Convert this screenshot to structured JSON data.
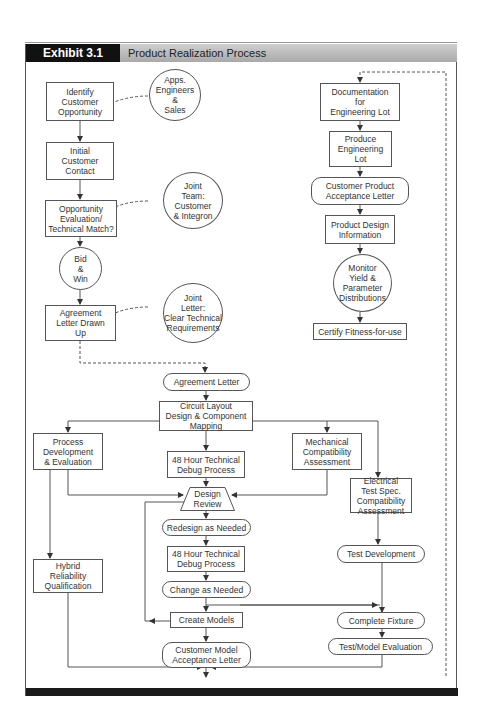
{
  "header": {
    "exhibit_label": "Exhibit 3.1",
    "title": "Product Realization Process"
  },
  "nodes": {
    "identify_customer": "Identify\nCustomer\nOpportunity",
    "apps_engineers": "Apps.\nEngineers\n&\nSales",
    "initial_contact": "Initial\nCustomer\nContact",
    "opportunity_eval": "Opportunity\nEvaluation/\nTechnical Match?",
    "joint_team": "Joint\nTeam:\nCustomer\n& Integron",
    "bid_win": "Bid\n&\nWin",
    "agreement_drawn": "Agreement\nLetter Drawn\nUp",
    "joint_letter": "Joint\nLetter:\nClear Technical\nRequirements",
    "documentation": "Documentation\nfor\nEngineering Lot",
    "produce_lot": "Produce\nEngineering\nLot",
    "cust_product_accept": "Customer Product\nAcceptance Letter",
    "product_design_info": "Product Design\nInformation",
    "monitor_yield": "Monitor\nYield &\nParameter\nDistributions",
    "certify": "Certify Fitness-for-use",
    "agreement_letter": "Agreement Letter",
    "circuit_layout": "Circuit Layout\nDesign & Component\nMapping",
    "process_dev": "Process\nDevelopment\n& Evaluation",
    "debug_1": "48 Hour Technical\nDebug Process",
    "mechanical": "Mechanical\nCompatibility\nAssessment",
    "design_review": "Design\nReview",
    "electrical": "Electrical\nTest Spec.\nCompatibility\nAssessment",
    "redesign": "Redesign as Needed",
    "debug_2": "48 Hour Technical\nDebug Process",
    "hybrid": "Hybrid\nReliability\nQualification",
    "test_dev": "Test Development",
    "change": "Change as Needed",
    "create_models": "Create Models",
    "complete_fixture": "Complete Fixture",
    "cust_model_accept": "Customer Model\nAcceptance Letter",
    "test_model_eval": "Test/Model Evaluation"
  },
  "colors": {
    "header_dark": "#111111",
    "header_gray": "#bcbcbc",
    "line": "#555555"
  }
}
